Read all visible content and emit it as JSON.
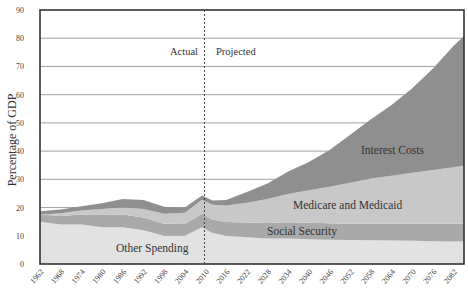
{
  "chart_data": {
    "type": "area",
    "stacked": true,
    "title": "",
    "xlabel": "",
    "ylabel": "Percentage of GDP",
    "ylim": [
      0,
      90
    ],
    "yticks": [
      0,
      10,
      20,
      30,
      40,
      50,
      60,
      70,
      80,
      90
    ],
    "grid": true,
    "x_ticks": [
      "1962",
      "1968",
      "1974",
      "1980",
      "1986",
      "1992",
      "1998",
      "2004",
      "2010",
      "2016",
      "2022",
      "2028",
      "2034",
      "2040",
      "2046",
      "2052",
      "2058",
      "2064",
      "2070",
      "2076",
      "2082"
    ],
    "x": [
      1962,
      1968,
      1974,
      1980,
      1986,
      1992,
      1998,
      2004,
      2009,
      2012,
      2016,
      2022,
      2028,
      2034,
      2040,
      2046,
      2052,
      2058,
      2064,
      2070,
      2076,
      2082,
      2085
    ],
    "divider": {
      "year": 2010,
      "left_label": "Actual",
      "right_label": "Projected"
    },
    "series": [
      {
        "name": "Other Spending",
        "color": "#e2e2e2",
        "values": [
          15,
          14,
          14,
          13,
          13,
          12,
          10,
          10,
          13,
          11,
          10,
          9.5,
          9,
          9,
          8.8,
          8.6,
          8.5,
          8.4,
          8.3,
          8.2,
          8.1,
          8,
          8
        ]
      },
      {
        "name": "Social Security",
        "color": "#a9a9a9",
        "values": [
          2.5,
          3,
          3.5,
          4.5,
          4.5,
          4.5,
          4.3,
          4.2,
          4.8,
          4.8,
          4.9,
          5.2,
          5.5,
          5.8,
          5.8,
          5.8,
          5.8,
          5.9,
          6,
          6.1,
          6.2,
          6.3,
          6.3
        ]
      },
      {
        "name": "Medicare and Medicaid",
        "color": "#c8c8c8",
        "values": [
          0,
          1,
          1.5,
          2,
          2.5,
          3,
          3.5,
          4,
          5,
          5.2,
          5.8,
          7,
          8.5,
          10,
          11.5,
          13,
          14.5,
          16,
          17,
          18,
          19,
          20,
          20.5
        ]
      },
      {
        "name": "Interest Costs",
        "color": "#8f8f8f",
        "values": [
          1.2,
          1.3,
          1.5,
          2,
          3,
          3.2,
          2.5,
          1.8,
          1.5,
          1.5,
          2,
          3.8,
          5.5,
          8,
          10,
          13,
          17,
          21,
          25,
          30,
          36,
          43,
          46
        ]
      }
    ],
    "totals": [
      18.7,
      19.3,
      20.5,
      21.5,
      23,
      22.7,
      20.3,
      20,
      24.3,
      22.5,
      22.7,
      25.5,
      28.5,
      32.8,
      36.1,
      40.4,
      45.8,
      51.3,
      56.3,
      62.3,
      69.3,
      77.3,
      80.8
    ],
    "annotations": [
      "Actual",
      "Projected",
      "Interest Costs",
      "Medicare and Medicaid",
      "Social Security",
      "Other Spending"
    ]
  },
  "labels": {
    "ylabel": "Percentage of GDP",
    "actual": "Actual",
    "projected": "Projected",
    "interest": "Interest Costs",
    "medicare": "Medicare and Medicaid",
    "social_security": "Social Security",
    "other": "Other Spending"
  }
}
